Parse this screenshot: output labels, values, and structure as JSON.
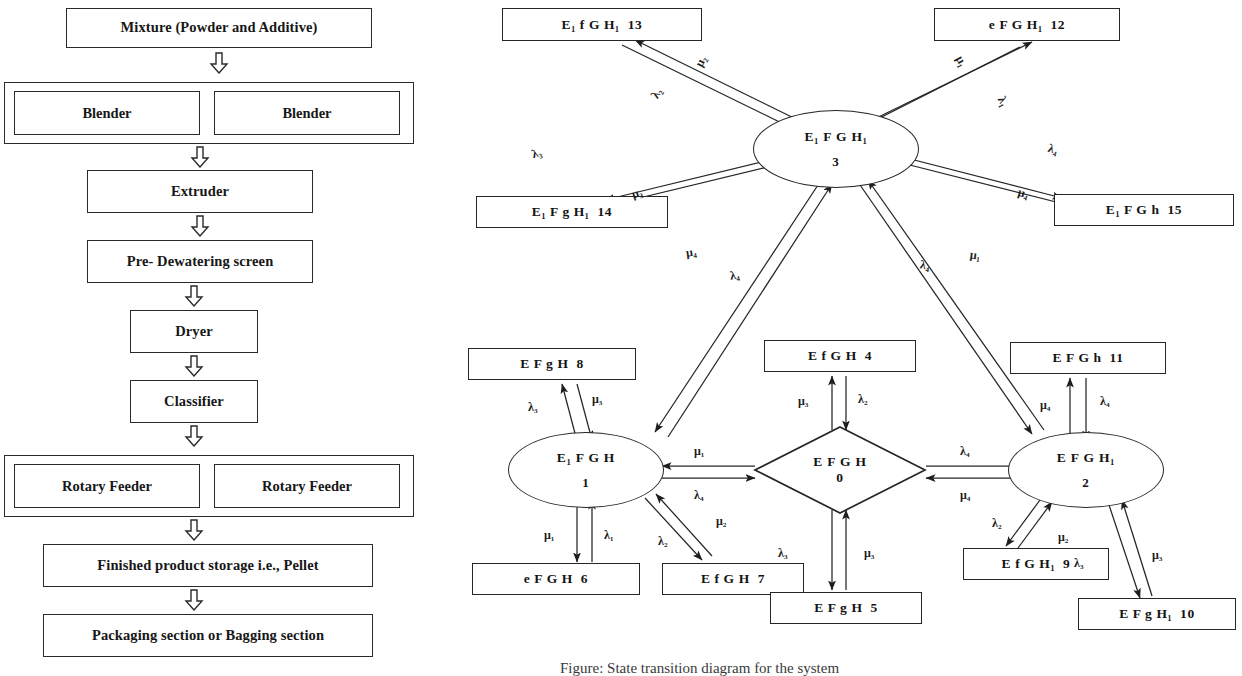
{
  "flowchart": {
    "title": "Pellet production process flow",
    "steps": [
      {
        "id": "mixture",
        "label": "Mixture (Powder and Additive)"
      },
      {
        "id": "blenders",
        "label": "",
        "children": [
          "Blender",
          "Blender"
        ]
      },
      {
        "id": "extruder",
        "label": "Extruder"
      },
      {
        "id": "predewater",
        "label": "Pre- Dewatering screen"
      },
      {
        "id": "dryer",
        "label": "Dryer"
      },
      {
        "id": "classifier",
        "label": "Classifier"
      },
      {
        "id": "feeders",
        "label": "",
        "children": [
          "Rotary Feeder",
          "Rotary Feeder"
        ]
      },
      {
        "id": "storage",
        "label": "Finished product storage i.e., Pellet"
      },
      {
        "id": "packaging",
        "label": "Packaging section or Bagging section"
      }
    ],
    "arrow_icon": "down-block-arrow-icon"
  },
  "state_diagram": {
    "caption": "Figure: State transition diagram for the system",
    "nodes": [
      {
        "key": "n13",
        "shape": "rect",
        "label": "E₁ f G H₁",
        "id": "13"
      },
      {
        "key": "n12",
        "shape": "rect",
        "label": "e F G H₁",
        "id": "12"
      },
      {
        "key": "n14",
        "shape": "rect",
        "label": "E₁ F g H₁",
        "id": "14"
      },
      {
        "key": "n15",
        "shape": "rect",
        "label": "E₁ F G h",
        "id": "15"
      },
      {
        "key": "n3",
        "shape": "ellipse",
        "label": "E₁ F G H₁",
        "id": "3"
      },
      {
        "key": "n8",
        "shape": "rect",
        "label": "E F g H",
        "id": "8"
      },
      {
        "key": "n4",
        "shape": "rect",
        "label": "E f G H",
        "id": "4"
      },
      {
        "key": "n11",
        "shape": "rect",
        "label": "E F G h",
        "id": "11"
      },
      {
        "key": "n1",
        "shape": "ellipse",
        "label": "E₁ F G H",
        "id": "1"
      },
      {
        "key": "n0",
        "shape": "diamond",
        "label": "E F G H",
        "id": "0"
      },
      {
        "key": "n2",
        "shape": "ellipse",
        "label": "E F G H₁",
        "id": "2"
      },
      {
        "key": "n6",
        "shape": "rect",
        "label": "e F G H",
        "id": "6"
      },
      {
        "key": "n7",
        "shape": "rect",
        "label": "E f G H",
        "id": "7"
      },
      {
        "key": "n9",
        "shape": "rect",
        "label": "E f G H₁",
        "id": "9"
      },
      {
        "key": "n5",
        "shape": "rect",
        "label": "E F g H",
        "id": "5"
      },
      {
        "key": "n10",
        "shape": "rect",
        "label": "E F g H₁",
        "id": "10"
      }
    ],
    "edge_labels": [
      {
        "key": "e1",
        "text": "μ₂"
      },
      {
        "key": "e2",
        "text": "λ₂"
      },
      {
        "key": "e3",
        "text": "μ₁"
      },
      {
        "key": "e4",
        "text": "λ₁"
      },
      {
        "key": "e5",
        "text": "λ₃"
      },
      {
        "key": "e6",
        "text": "μ₃"
      },
      {
        "key": "e7",
        "text": "λ₄"
      },
      {
        "key": "e8",
        "text": "μ₄"
      },
      {
        "key": "e9",
        "text": "μ₄"
      },
      {
        "key": "e10",
        "text": "λ₄"
      },
      {
        "key": "e11",
        "text": "λ₄"
      },
      {
        "key": "e12",
        "text": "μ₁"
      },
      {
        "key": "e13",
        "text": "λ₃"
      },
      {
        "key": "e14",
        "text": "μ₃"
      },
      {
        "key": "e15",
        "text": "μ₃"
      },
      {
        "key": "e16",
        "text": "λ₂"
      },
      {
        "key": "e17",
        "text": "μ₄"
      },
      {
        "key": "e18",
        "text": "λ₄"
      },
      {
        "key": "e19",
        "text": "μ₁"
      },
      {
        "key": "e20",
        "text": "λ₄"
      },
      {
        "key": "e21",
        "text": "λ₄"
      },
      {
        "key": "e22",
        "text": "μ₄"
      },
      {
        "key": "e23",
        "text": "μ₁"
      },
      {
        "key": "e24",
        "text": "λ₁"
      },
      {
        "key": "e25",
        "text": "λ₂"
      },
      {
        "key": "e26",
        "text": "μ₂"
      },
      {
        "key": "e27",
        "text": "λ₂"
      },
      {
        "key": "e28",
        "text": "μ₂"
      },
      {
        "key": "e29",
        "text": "λ₃"
      },
      {
        "key": "e30",
        "text": "μ₃"
      },
      {
        "key": "e31",
        "text": "λ₃"
      },
      {
        "key": "e32",
        "text": "μ₃"
      }
    ]
  },
  "colors": {
    "stroke": "#262626",
    "text": "#141414",
    "background": "#ffffff"
  }
}
